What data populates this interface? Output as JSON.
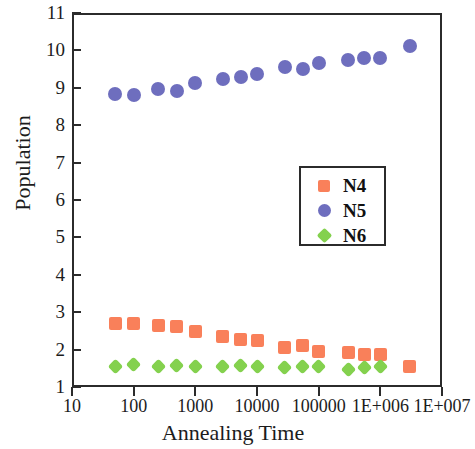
{
  "chart_data": {
    "type": "scatter",
    "title": "",
    "xlabel": "Annealing Time",
    "ylabel": "Population",
    "xscale": "log",
    "yscale": "linear",
    "xlim": [
      10,
      10000000
    ],
    "ylim": [
      1,
      11
    ],
    "grid": false,
    "legend_position": "center-right",
    "xtick_labels": [
      "10",
      "100",
      "1000",
      "10000",
      "100000",
      "1E+006",
      "1E+007"
    ],
    "xtick_values": [
      10,
      100,
      1000,
      10000,
      100000,
      1000000,
      10000000
    ],
    "ytick_labels": [
      "1",
      "2",
      "3",
      "4",
      "5",
      "6",
      "7",
      "8",
      "9",
      "10",
      "11"
    ],
    "ytick_values": [
      1,
      2,
      3,
      4,
      5,
      6,
      7,
      8,
      9,
      10,
      11
    ],
    "series": [
      {
        "name": "N4",
        "marker": "square",
        "color": "#F9805A",
        "x": [
          50,
          100,
          250,
          500,
          1000,
          2800,
          5500,
          10000,
          28000,
          55000,
          100000,
          300000,
          550000,
          1000000,
          3000000
        ],
        "y": [
          2.7,
          2.7,
          2.64,
          2.62,
          2.48,
          2.36,
          2.27,
          2.24,
          2.06,
          2.12,
          1.95,
          1.93,
          1.87,
          1.86,
          1.56
        ]
      },
      {
        "name": "N5",
        "marker": "circle",
        "color": "#6E6EBE",
        "x": [
          50,
          100,
          250,
          500,
          1000,
          2800,
          5500,
          10000,
          28000,
          55000,
          100000,
          300000,
          550000,
          1000000,
          3000000
        ],
        "y": [
          8.83,
          8.8,
          8.96,
          8.92,
          9.13,
          9.24,
          9.28,
          9.37,
          9.55,
          9.51,
          9.67,
          9.74,
          9.81,
          9.8,
          10.11
        ]
      },
      {
        "name": "N6",
        "marker": "diamond",
        "color": "#84D14E",
        "x": [
          50,
          100,
          250,
          500,
          1000,
          2800,
          5500,
          10000,
          28000,
          55000,
          100000,
          300000,
          550000,
          1000000
        ],
        "y": [
          1.56,
          1.6,
          1.54,
          1.57,
          1.55,
          1.54,
          1.58,
          1.54,
          1.52,
          1.55,
          1.55,
          1.48,
          1.51,
          1.54
        ]
      }
    ],
    "legend": [
      {
        "label": "N4",
        "marker": "square",
        "color": "#F9805A"
      },
      {
        "label": "N5",
        "marker": "circle",
        "color": "#6E6EBE"
      },
      {
        "label": "N6",
        "marker": "diamond",
        "color": "#84D14E"
      }
    ]
  }
}
